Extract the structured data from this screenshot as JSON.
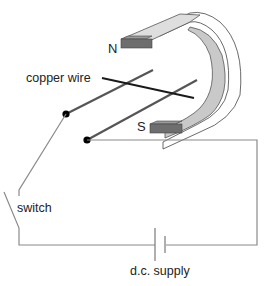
{
  "diagram": {
    "labels": {
      "north_pole": "N",
      "south_pole": "S",
      "copper_wire": "copper wire",
      "switch": "switch",
      "supply": "d.c. supply"
    },
    "components": [
      "horseshoe magnet",
      "two metal rails",
      "copper wire",
      "switch",
      "d.c. cell"
    ],
    "colors": {
      "magnet_light": "#dcdcdc",
      "magnet_mid": "#c8c8c8",
      "magnet_pole": "#6e6e6e",
      "rail": "#555555",
      "wire": "#1a1a1a",
      "circuit": "#8a8a8a",
      "terminal": "#000000"
    }
  }
}
